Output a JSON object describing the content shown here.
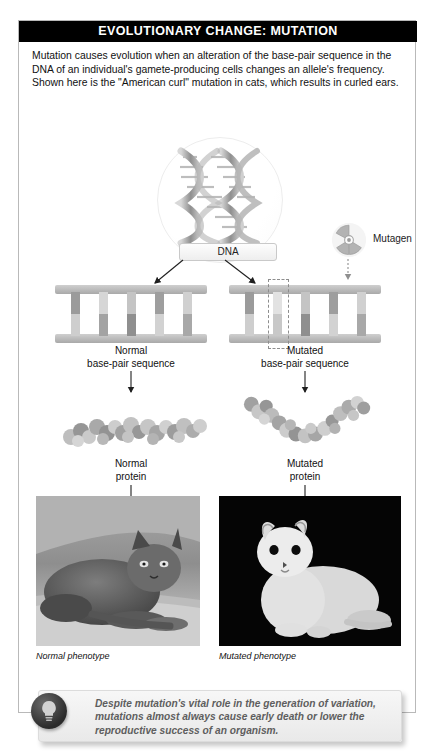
{
  "header": {
    "title": "EVOLUTIONARY CHANGE: MUTATION"
  },
  "intro": {
    "text": "Mutation causes evolution when an alteration of the base-pair sequence in the DNA of an individual's gamete-producing cells changes an allele's frequency. Shown here is the \"American curl\" mutation in cats, which results in curled ears."
  },
  "diagram": {
    "dna_label": "DNA",
    "mutagen_label": "Mutagen",
    "mutagen_icon": "radiation-trefoil-icon",
    "helix_icon": "dna-double-helix-icon",
    "normal": {
      "sequence_label_line1": "Normal",
      "sequence_label_line2": "base-pair sequence",
      "protein_label_line1": "Normal",
      "protein_label_line2": "protein",
      "caption": "Normal phenotype",
      "photo_alt": "gray cat with normal straight ears resting on a couch"
    },
    "mutated": {
      "sequence_label_line1": "Mutated",
      "sequence_label_line2": "base-pair sequence",
      "protein_label_line1": "Mutated",
      "protein_label_line2": "protein",
      "caption": "Mutated phenotype",
      "photo_alt": "white American curl cat with curled ears on black background"
    },
    "rung_count": 5,
    "mutated_rung_index": 2
  },
  "callout": {
    "icon": "lightbulb-icon",
    "text": "Despite mutation's vital role in the generation of variation, mutations almost always cause early death or lower the reproductive success of an organism."
  },
  "colors": {
    "header_bg": "#000000",
    "card_border": "#b9b9b9",
    "rail": "#a9a9a9",
    "callout_text": "#5e5e5e"
  }
}
